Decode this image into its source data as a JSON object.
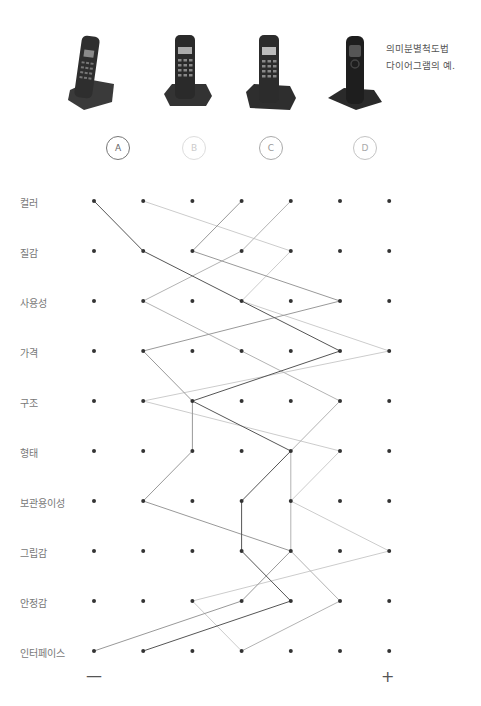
{
  "caption": {
    "line1": "의미분별척도법",
    "line2": "다이어그램의 예."
  },
  "products": [
    {
      "id": "A",
      "label": "A",
      "color": "#555555",
      "border": "#777777"
    },
    {
      "id": "B",
      "label": "B",
      "color": "#cccccc",
      "border": "#d8d8d8"
    },
    {
      "id": "C",
      "label": "C",
      "color": "#999999",
      "border": "#aaaaaa"
    },
    {
      "id": "D",
      "label": "D",
      "color": "#b3b3b3",
      "border": "#c4c4c4"
    }
  ],
  "axis": {
    "minus": "—",
    "plus": "+"
  },
  "rows": [
    "컬러",
    "질감",
    "사용성",
    "가격",
    "구조",
    "형태",
    "보관용이성",
    "그립감",
    "안정감",
    "인터페이스"
  ],
  "chart_data": {
    "type": "line",
    "title": "의미분별척도법 다이어그램의 예.",
    "categories": [
      "컬러",
      "질감",
      "사용성",
      "가격",
      "구조",
      "형태",
      "보관용이성",
      "그립감",
      "안정감",
      "인터페이스"
    ],
    "scale": {
      "min": 1,
      "max": 7,
      "min_label": "—",
      "max_label": "+"
    },
    "series": [
      {
        "name": "A",
        "values": [
          1,
          2,
          4,
          6,
          3,
          5,
          4,
          4,
          5,
          2
        ]
      },
      {
        "name": "B",
        "values": [
          2,
          5,
          4,
          7,
          2,
          6,
          5,
          7,
          3,
          4
        ]
      },
      {
        "name": "C",
        "values": [
          4,
          3,
          6,
          2,
          3,
          3,
          2,
          5,
          4,
          1
        ]
      },
      {
        "name": "D",
        "values": [
          5,
          4,
          2,
          4,
          6,
          5,
          5,
          5,
          6,
          4
        ]
      }
    ],
    "grid": "7 columns × 10 rows of dots"
  }
}
